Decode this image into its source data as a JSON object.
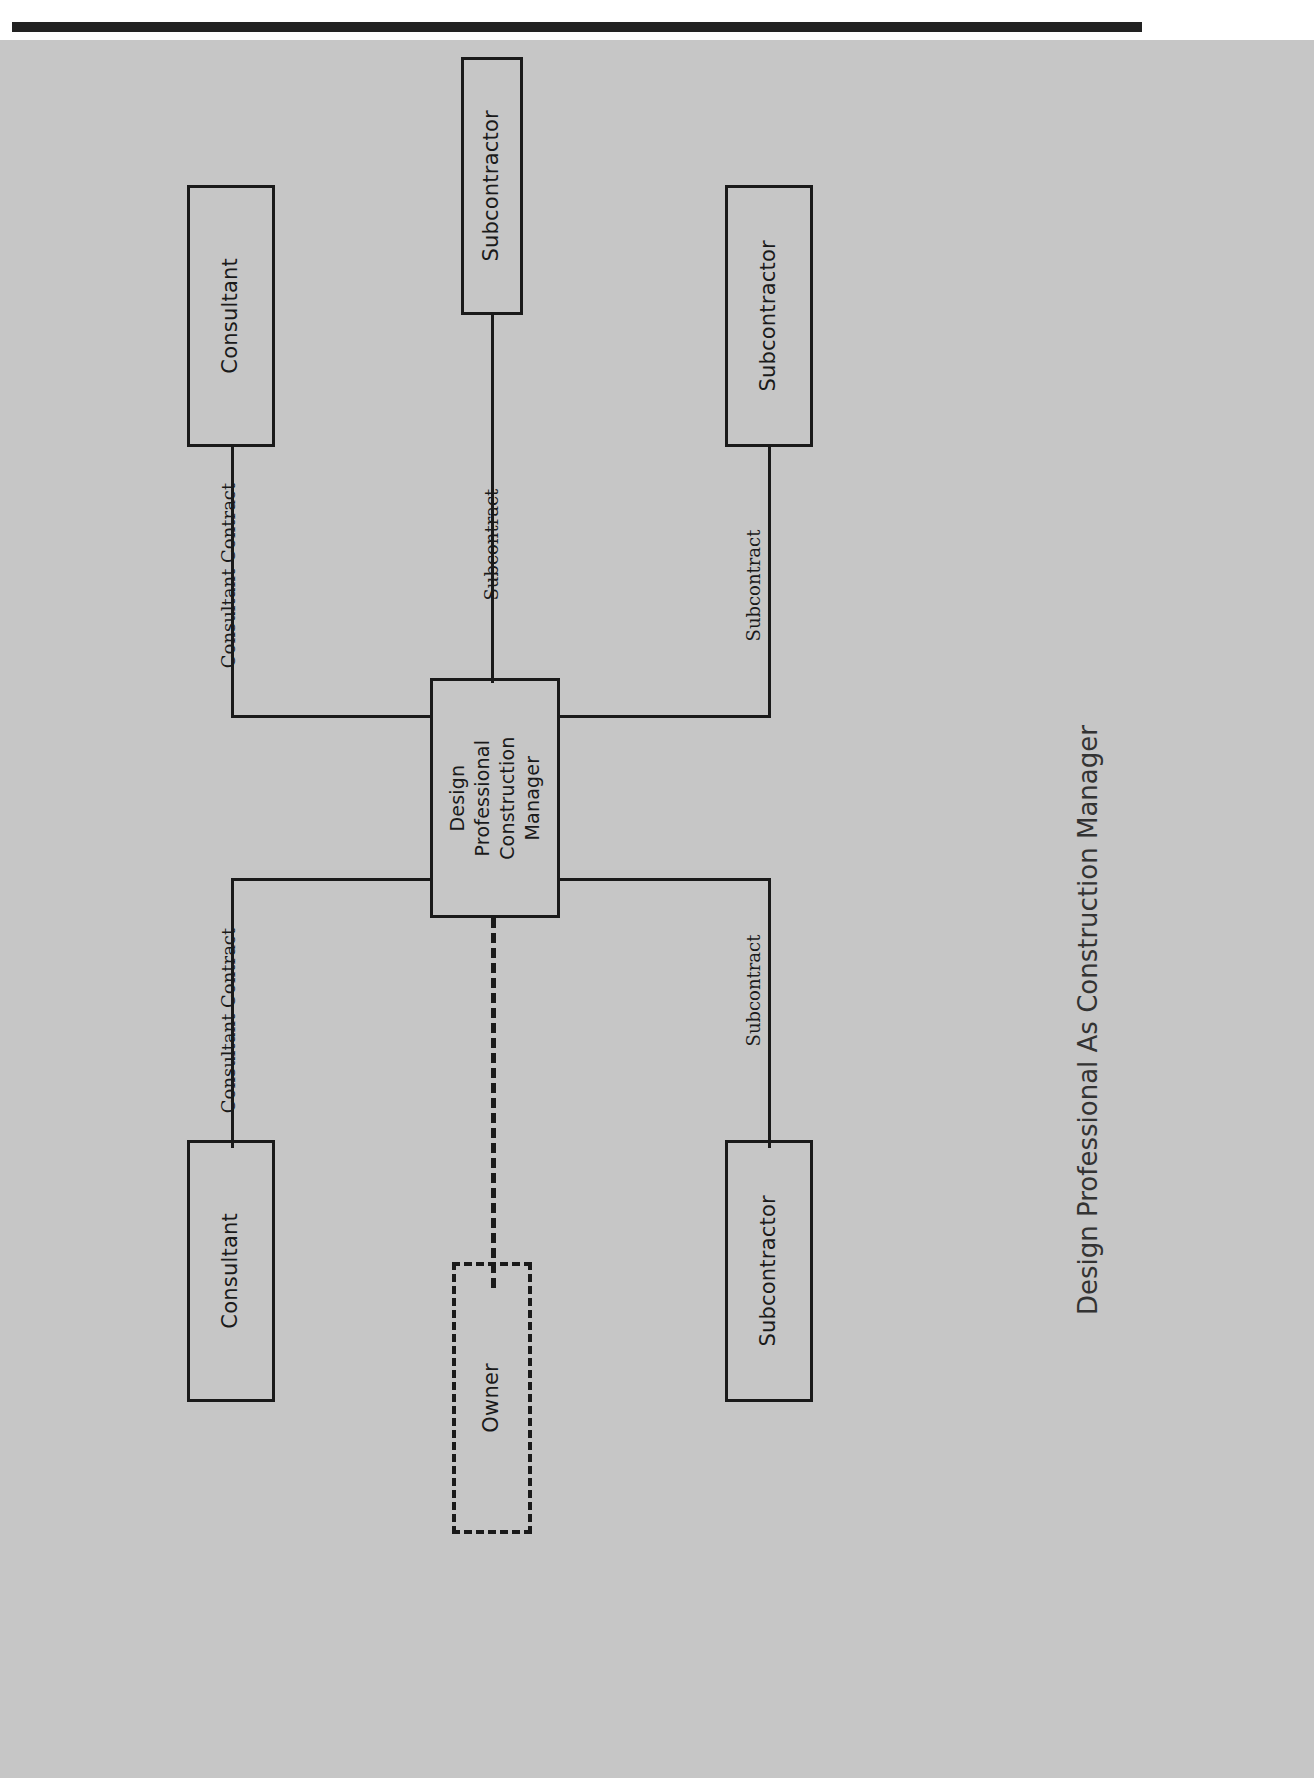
{
  "document": {
    "caption": "Design Professional As Construction Manager",
    "orientation": "rotated-90-ccw",
    "page_background": "#c6c6c6",
    "ink_color": "#1a1a1a",
    "scan_bar_color": "#222222"
  },
  "diagram": {
    "type": "organizational-chart",
    "central_node": {
      "id": "design-professional-cm",
      "label": "Design\nProfessional\nConstruction\nManager",
      "border": "solid"
    },
    "nodes": [
      {
        "id": "subcontractor-top",
        "label": "Subcontractor",
        "border": "solid"
      },
      {
        "id": "consultant-top-left",
        "label": "Consultant",
        "border": "solid"
      },
      {
        "id": "subcontractor-top-right",
        "label": "Subcontractor",
        "border": "solid"
      },
      {
        "id": "consultant-bottom-left",
        "label": "Consultant",
        "border": "solid"
      },
      {
        "id": "subcontractor-bottom",
        "label": "Subcontractor",
        "border": "solid"
      },
      {
        "id": "owner",
        "label": "Owner",
        "border": "dashed"
      }
    ],
    "edges": [
      {
        "id": "edge-subcontract-top",
        "from": "design-professional-cm",
        "to": "subcontractor-top",
        "label": "Subcontract",
        "style": "solid"
      },
      {
        "id": "edge-consultant-top-left",
        "from": "design-professional-cm",
        "to": "consultant-top-left",
        "label": "Consultant Contract",
        "style": "solid"
      },
      {
        "id": "edge-subcontract-top-right",
        "from": "design-professional-cm",
        "to": "subcontractor-top-right",
        "label": "Subcontract",
        "style": "solid"
      },
      {
        "id": "edge-consultant-bottom-left",
        "from": "design-professional-cm",
        "to": "consultant-bottom-left",
        "label": "Consultant Contract",
        "style": "solid"
      },
      {
        "id": "edge-subcontract-bottom",
        "from": "design-professional-cm",
        "to": "subcontractor-bottom",
        "label": "Subcontract",
        "style": "solid"
      },
      {
        "id": "edge-owner",
        "from": "design-professional-cm",
        "to": "owner",
        "label": "",
        "style": "dashed"
      }
    ]
  }
}
